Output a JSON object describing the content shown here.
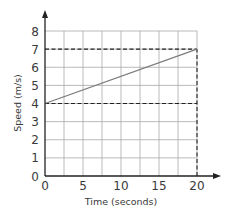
{
  "chart_data": {
    "type": "line",
    "xlabel": "Time (seconds)",
    "ylabel": "Speed (m/s)",
    "xlim": [
      0,
      20
    ],
    "ylim": [
      0,
      8
    ],
    "x_ticks": [
      0,
      5,
      10,
      15,
      20
    ],
    "y_ticks": [
      0,
      1,
      2,
      3,
      4,
      5,
      6,
      7,
      8
    ],
    "x_gridlines_every": 2.5,
    "y_gridlines_every": 1,
    "grid": true,
    "series": [
      {
        "name": "speed",
        "x": [
          0,
          20
        ],
        "y": [
          4,
          7
        ],
        "style": "solid",
        "color": "#7a7a7a"
      }
    ],
    "reference_lines": [
      {
        "type": "horizontal",
        "y": 7,
        "from_x": 0,
        "to_x": 20,
        "style": "dashed"
      },
      {
        "type": "horizontal",
        "y": 4,
        "from_x": 0,
        "to_x": 20,
        "style": "dashed"
      },
      {
        "type": "vertical",
        "x": 20,
        "from_y": 0,
        "to_y": 7,
        "style": "dashed"
      }
    ],
    "legend": null
  },
  "labels": {
    "x_axis": "Time (seconds)",
    "y_axis": "Speed (m/s)",
    "x_ticks": [
      "0",
      "5",
      "10",
      "15",
      "20"
    ],
    "y_ticks": [
      "0",
      "1",
      "2",
      "3",
      "4",
      "5",
      "6",
      "7",
      "8"
    ]
  },
  "colors": {
    "axis": "#222222",
    "grid": "#a8a8a8",
    "line": "#7a7a7a",
    "dashed": "#222222",
    "text": "#3a3a3a"
  }
}
